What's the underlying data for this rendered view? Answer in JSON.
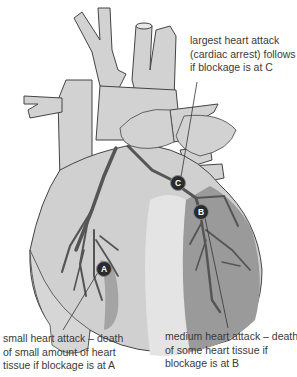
{
  "diagram": {
    "markers": [
      {
        "id": "A",
        "label": "A"
      },
      {
        "id": "B",
        "label": "B"
      },
      {
        "id": "C",
        "label": "C"
      }
    ],
    "annotations": {
      "c": {
        "lines": [
          "largest heart attack",
          "(cardiac arrest) follows",
          "if blockage is at C"
        ]
      },
      "a": {
        "lines": [
          "small heart attack – death",
          "of small amount of heart",
          "tissue if blockage is at A"
        ]
      },
      "b": {
        "lines": [
          "medium heart attack – death",
          "of some heart tissue if",
          "blockage is at B"
        ]
      }
    },
    "colors": {
      "heart_fill": "#d0d0d0",
      "heart_light": "#e4e4e4",
      "damaged_tissue": "#9a9a9a",
      "artery": "#5a5a5a",
      "outline": "#444444",
      "marker_fill": "#2b2b2b",
      "text": "#3a3a3a"
    }
  }
}
